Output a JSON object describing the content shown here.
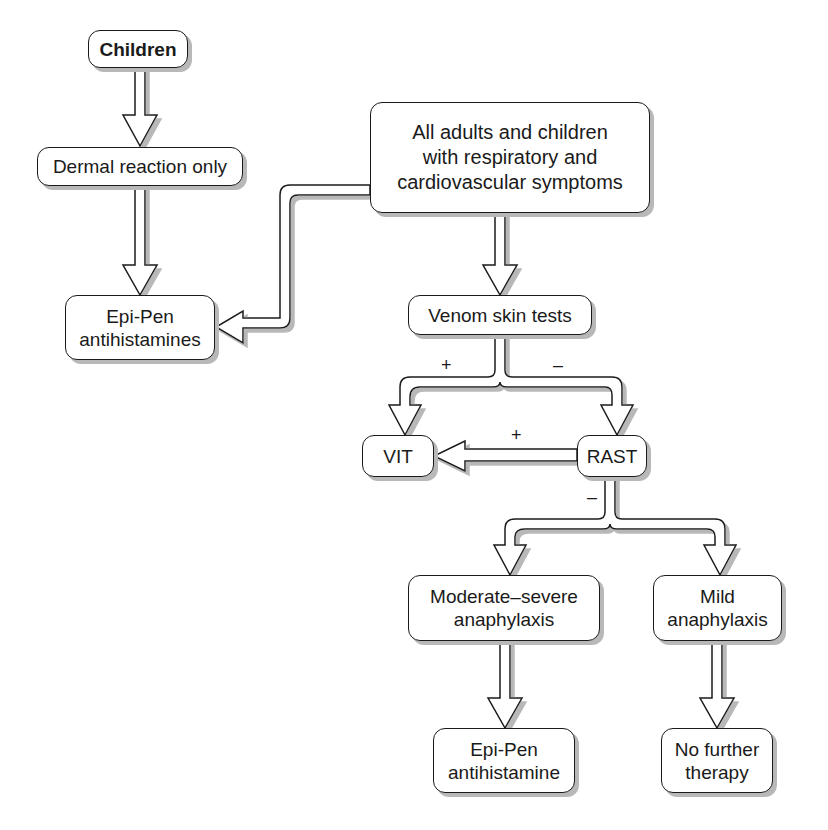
{
  "nodes": {
    "children": "Children",
    "dermal": "Dermal reaction only",
    "epipen_antihistamines": "Epi-Pen\nantihistamines",
    "all_adults": "All adults and children\nwith respiratory and\ncardiovascular symptoms",
    "venom_skin_tests": "Venom skin tests",
    "vit": "VIT",
    "rast": "RAST",
    "moderate_severe": "Moderate–severe\nanaphylaxis",
    "mild": "Mild\nanaphylaxis",
    "epipen_antihistamine": "Epi-Pen\nantihistamine",
    "no_further": "No further\ntherapy"
  },
  "labels": {
    "skin_positive": "+",
    "skin_negative": "–",
    "rast_positive": "+",
    "rast_negative": "–"
  },
  "edges": [
    {
      "from": "Children",
      "to": "Dermal reaction only"
    },
    {
      "from": "Dermal reaction only",
      "to": "Epi-Pen antihistamines"
    },
    {
      "from": "All adults and children with respiratory and cardiovascular symptoms",
      "to": "Epi-Pen antihistamines"
    },
    {
      "from": "All adults and children with respiratory and cardiovascular symptoms",
      "to": "Venom skin tests"
    },
    {
      "from": "Venom skin tests",
      "to": "VIT",
      "label": "+"
    },
    {
      "from": "Venom skin tests",
      "to": "RAST",
      "label": "–"
    },
    {
      "from": "RAST",
      "to": "VIT",
      "label": "+"
    },
    {
      "from": "RAST",
      "to": "Moderate–severe anaphylaxis",
      "label": "–"
    },
    {
      "from": "RAST",
      "to": "Mild anaphylaxis",
      "label": "–"
    },
    {
      "from": "Moderate–severe anaphylaxis",
      "to": "Epi-Pen antihistamine"
    },
    {
      "from": "Mild anaphylaxis",
      "to": "No further therapy"
    }
  ]
}
